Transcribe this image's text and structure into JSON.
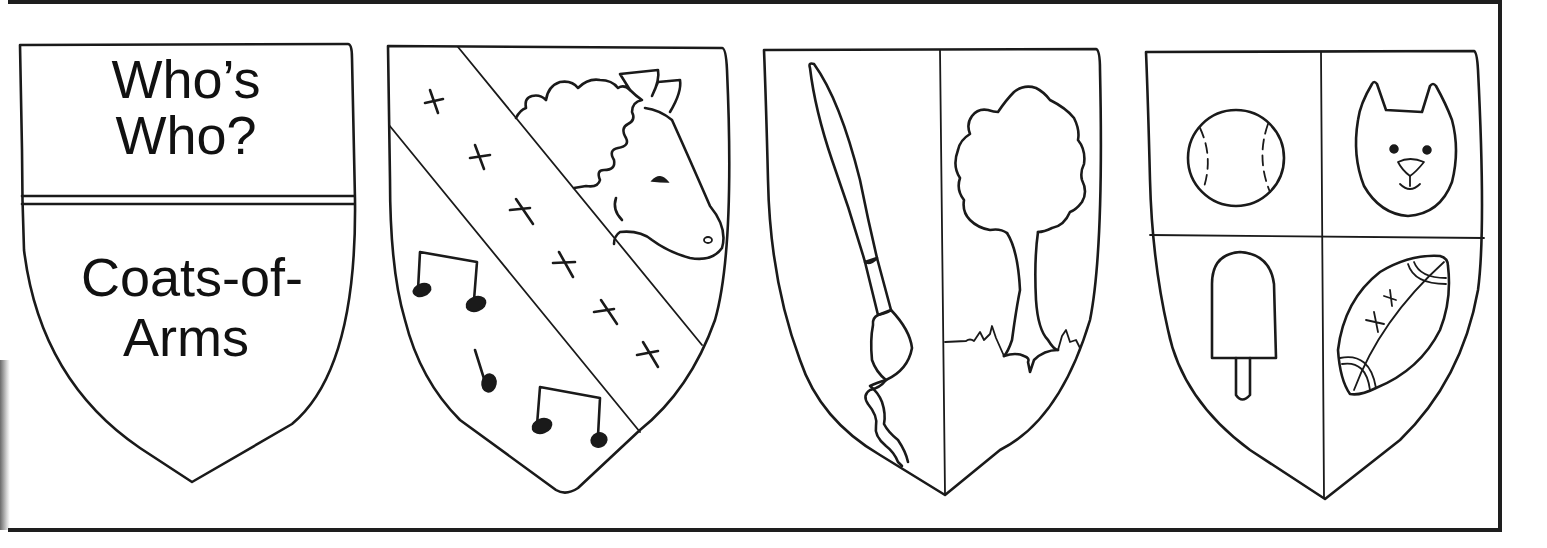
{
  "page": {
    "ink_color": "#1a1a1a",
    "background_color": "#ffffff"
  },
  "title_shield": {
    "top_lines": [
      "Who’s",
      "Who?"
    ],
    "bottom_lines": [
      "Coats-of-",
      "Arms"
    ]
  },
  "shields": [
    {
      "label": "title shield",
      "division": "per fess (double line)",
      "charges": [
        "Who’s Who?",
        "Coats-of-Arms"
      ]
    },
    {
      "label": "bend shield",
      "division": "bend sinister band",
      "charges": [
        "horse head",
        "six crosses on band",
        "eighth-note pairs",
        "single eighth note"
      ]
    },
    {
      "label": "per pale shield",
      "division": "per pale",
      "charges": [
        "paintbrush",
        "tree with grass"
      ]
    },
    {
      "label": "quarterly shield",
      "division": "quarterly",
      "charges": [
        "baseball",
        "cat face",
        "ice pop",
        "football"
      ]
    }
  ]
}
